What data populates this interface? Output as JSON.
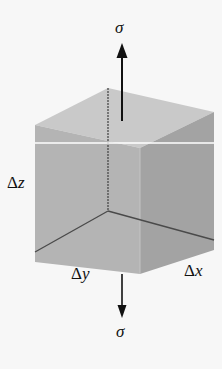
{
  "diagram": {
    "type": "stress element cube",
    "labels": {
      "sigma_top": "σ",
      "sigma_bottom": "σ",
      "dz_delta": "Δ",
      "dz_var": "z",
      "dy_delta": "Δ",
      "dy_var": "y",
      "dx_delta": "Δ",
      "dx_var": "x"
    },
    "colors": {
      "background": "#f7f7f7",
      "top_face": "#c9c9c9",
      "left_face": "#b3b3b3",
      "right_face": "#a2a2a2",
      "hidden_edge": "#4a4a4a",
      "arrow": "#111111",
      "section_line": "#ffffff"
    }
  }
}
